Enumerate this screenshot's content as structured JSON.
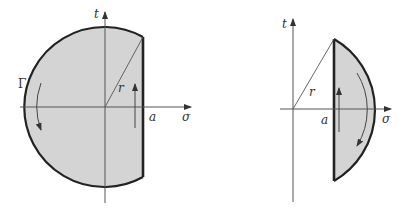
{
  "figure": {
    "left": {
      "labels": {
        "t": "t",
        "sigma": "σ",
        "r": "r",
        "a": "a",
        "gamma": "Γ"
      },
      "region": "disc sector of radius r left of the line σ = a (a > 0)",
      "contour_orientation": "counterclockwise"
    },
    "right": {
      "labels": {
        "t": "t",
        "sigma": "σ",
        "r": "r",
        "a": "a"
      },
      "region": "circular segment of radius r right of the line σ = a",
      "contour_orientation": "clockwise arc, upward along σ = a"
    },
    "colors": {
      "fill": "#d4d4d4",
      "stroke": "#222222",
      "axis": "#555555"
    }
  }
}
